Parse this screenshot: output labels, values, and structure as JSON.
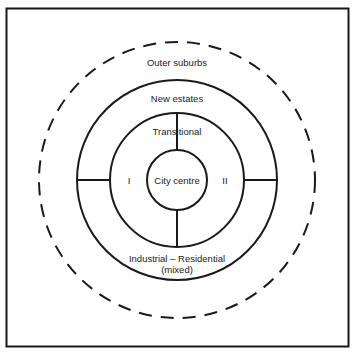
{
  "diagram": {
    "type": "concentric-zone-model",
    "zones": {
      "outer": "Outer suburbs",
      "new_estates": "New estates",
      "transitional": "Transitional",
      "city_centre": "City centre",
      "sector_left": "I",
      "sector_right": "II",
      "industrial_line1": "Industrial – Residential",
      "industrial_line2": "(mixed)"
    },
    "colors": {
      "line": "#1a1a1a",
      "background": "#ffffff"
    }
  }
}
